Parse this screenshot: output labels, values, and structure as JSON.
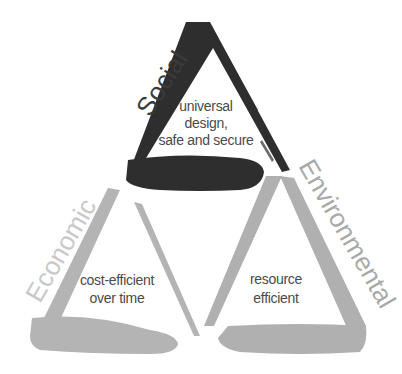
{
  "diagram": {
    "type": "sustainability-triangle",
    "triangles": [
      {
        "pillar": "Social",
        "lines": [
          "universal",
          "design,",
          "safe and secure"
        ],
        "color": "#2e2e2e",
        "label_color": "#3a3a3a"
      },
      {
        "pillar": "Economic",
        "lines": [
          "cost-efficient",
          "over time"
        ],
        "color": "#b4b4b4",
        "label_color": "#c8c8c8"
      },
      {
        "pillar": "Environmental",
        "lines": [
          "resource",
          "efficient"
        ],
        "color": "#b0b0b0",
        "label_color": "#a8a8a8"
      }
    ]
  }
}
